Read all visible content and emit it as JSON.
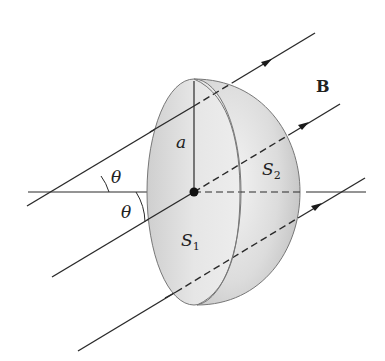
{
  "diagram": {
    "labels": {
      "field": "B",
      "radius": "a",
      "angle_upper": "θ",
      "angle_lower": "θ",
      "surface_flat": "S",
      "surface_flat_sub": "1",
      "surface_dome": "S",
      "surface_dome_sub": "2"
    },
    "colors": {
      "line": "#2a2a2a",
      "shade_light": "#f2f2f2",
      "shade_dark": "#c4c4c4",
      "outline": "#777777"
    }
  }
}
